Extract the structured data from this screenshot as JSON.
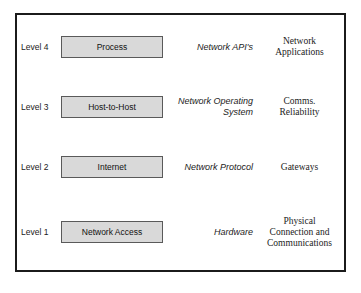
{
  "diagram": {
    "frame_color": "#1b1b1b",
    "box_fill": "#d9d9d9",
    "box_border": "#5a5a5a",
    "columns": {
      "level": "Level",
      "component": "Component",
      "service": "Service",
      "function": "Function"
    },
    "rows": [
      {
        "level": "Level 4",
        "box": "Process",
        "italic": "Network API's",
        "function_lines": [
          "Network",
          "Applications"
        ],
        "function": "Network Applications"
      },
      {
        "level": "Level 3",
        "box": "Host-to-Host",
        "italic": "Network Operating System",
        "function_lines": [
          "Comms.",
          "Reliability"
        ],
        "function": "Comms. Reliability"
      },
      {
        "level": "Level 2",
        "box": "Internet",
        "italic": "Network Protocol",
        "function_lines": [
          "Gateways"
        ],
        "function": "Gateways"
      },
      {
        "level": "Level 1",
        "box": "Network Access",
        "italic": "Hardware",
        "function_lines": [
          "Physical",
          "Connection and",
          "Communications"
        ],
        "function": "Physical Connection and Communications"
      }
    ]
  }
}
